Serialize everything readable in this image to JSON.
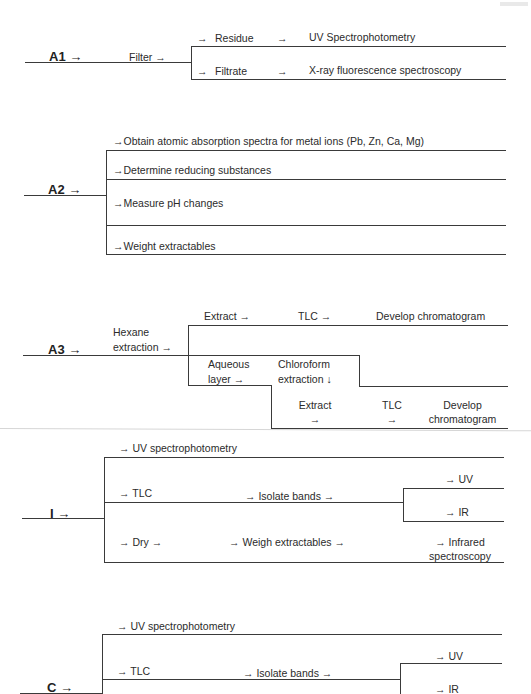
{
  "corner_fragment": "",
  "sections": {
    "A1": {
      "label": "A1 →",
      "step": "Filter →",
      "branches": [
        {
          "arrow": "→",
          "name": "Residue",
          "arrow2": "→",
          "result": "UV Spectrophotometry"
        },
        {
          "arrow": "→",
          "name": "Filtrate",
          "arrow2": "→",
          "result": "X-ray fluorescence spectroscopy"
        }
      ]
    },
    "A2": {
      "label": "A2 →",
      "branches": [
        "→Obtain atomic absorption spectra for metal ions (Pb, Zn, Ca, Mg)",
        "→Determine reducing substances",
        "→Measure pH changes",
        "→Weight extractables"
      ]
    },
    "A3": {
      "label": "A3 →",
      "step_line1": "Hexane",
      "step_line2": "extraction →",
      "top_branch": {
        "extract": "Extract →",
        "tlc": "TLC →",
        "result": "Develop chromatogram"
      },
      "aqueous_line1": "Aqueous",
      "aqueous_line2": "layer →",
      "chloroform_line1": "Chloroform",
      "chloroform_line2": "extraction ↓",
      "lower_branch": {
        "extract_line1": "Extract",
        "extract_line2": "→",
        "tlc_line1": "TLC",
        "tlc_line2": "→",
        "result_line1": "Develop",
        "result_line2": "chromatogram"
      }
    },
    "I": {
      "label": "I →",
      "uv": "→ UV spectrophotometry",
      "tlc": "→ TLC",
      "isolate": "→ Isolate bands →",
      "sub_uv": "→ UV",
      "sub_ir": "→ IR",
      "dry": "→ Dry →",
      "weigh": "→ Weigh extractables →",
      "infrared_line1": "→ Infrared",
      "infrared_line2": "spectroscopy"
    },
    "C": {
      "label": "C →",
      "uv": "→ UV spectrophotometry",
      "tlc": "→ TLC",
      "isolate": "→ Isolate bands →",
      "sub_uv": "→ UV",
      "sub_ir": "→ IR"
    }
  }
}
